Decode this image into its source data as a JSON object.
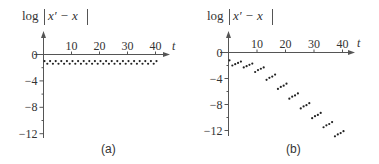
{
  "chart_data": [
    {
      "panel": "(a)",
      "type": "scatter",
      "title": "",
      "ylabel": "log|x′ − x|",
      "xlabel": "t",
      "xticks": [
        "10",
        "20",
        "30",
        "40"
      ],
      "yticks": [
        "0",
        "−4",
        "−8",
        "−12"
      ],
      "xlim": [
        0,
        45
      ],
      "ylim": [
        -13,
        0
      ],
      "grid": false,
      "x": [
        0,
        1,
        2,
        3,
        4,
        5,
        6,
        7,
        8,
        9,
        10,
        11,
        12,
        13,
        14,
        15,
        16,
        17,
        18,
        19,
        20,
        21,
        22,
        23,
        24,
        25,
        26,
        27,
        28,
        29,
        30,
        31,
        32,
        33,
        34,
        35,
        36,
        37,
        38,
        39,
        40
      ],
      "values": [
        -1.0,
        -1.4,
        -1.0,
        -1.4,
        -1.0,
        -1.4,
        -1.0,
        -1.4,
        -1.0,
        -1.4,
        -1.0,
        -1.4,
        -1.0,
        -1.4,
        -1.0,
        -1.4,
        -1.0,
        -1.4,
        -1.0,
        -1.4,
        -1.0,
        -1.4,
        -1.0,
        -1.4,
        -1.0,
        -1.4,
        -1.0,
        -1.4,
        -1.0,
        -1.4,
        -1.0,
        -1.4,
        -1.0,
        -1.4,
        -1.0,
        -1.4,
        -1.0,
        -1.4,
        -1.0,
        -1.4,
        -1.0
      ]
    },
    {
      "panel": "(b)",
      "type": "scatter",
      "title": "",
      "ylabel": "log|x′ − x|",
      "xlabel": "t",
      "xticks": [
        "10",
        "20",
        "30",
        "40"
      ],
      "yticks": [
        "0",
        "−4",
        "−8",
        "−12"
      ],
      "xlim": [
        0,
        45
      ],
      "ylim": [
        -13,
        0
      ],
      "grid": false,
      "x": [
        0,
        1,
        2,
        3,
        4,
        5,
        6,
        7,
        8,
        9,
        10,
        11,
        12,
        13,
        14,
        15,
        16,
        17,
        18,
        19,
        20,
        21,
        22,
        23,
        24,
        25,
        26,
        27,
        28,
        29,
        30,
        31,
        32,
        33,
        34,
        35,
        36,
        37,
        38,
        39,
        40
      ],
      "values": [
        -1.2,
        -2.0,
        -1.8,
        -1.6,
        -1.4,
        -2.3,
        -2.1,
        -1.9,
        -1.7,
        -3.0,
        -2.7,
        -2.5,
        -2.3,
        -4.2,
        -3.9,
        -3.7,
        -3.4,
        -5.6,
        -5.3,
        -5.1,
        -4.8,
        -7.1,
        -6.8,
        -6.6,
        -6.3,
        -8.6,
        -8.3,
        -8.1,
        -7.8,
        -10.1,
        -9.8,
        -9.6,
        -9.3,
        -11.5,
        -11.2,
        -11.0,
        -10.7,
        -12.9,
        -12.6,
        -12.4,
        -12.1
      ]
    }
  ],
  "panels": {
    "a": {
      "ylabel_log": "log",
      "ylabel_expr": "x′ − x",
      "xlabel": "t",
      "caption": "(a)",
      "xticks": [
        "10",
        "20",
        "30",
        "40"
      ],
      "yticks": [
        "0",
        "−4",
        "−8",
        "−12"
      ]
    },
    "b": {
      "ylabel_log": "log",
      "ylabel_expr": "x′ − x",
      "xlabel": "t",
      "caption": "(b)",
      "xticks": [
        "10",
        "20",
        "30",
        "40"
      ],
      "yticks": [
        "0",
        "−4",
        "−8",
        "−12"
      ]
    }
  },
  "colors": {
    "axis": "#555555",
    "points": "#222222",
    "text": "#333333"
  }
}
